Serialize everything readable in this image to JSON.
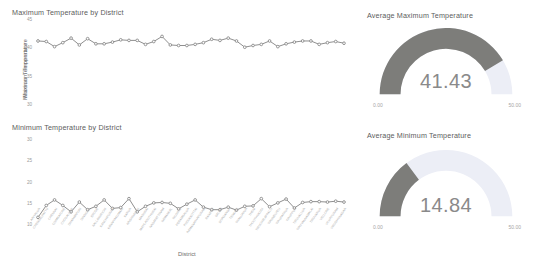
{
  "panels": {
    "max_line": {
      "title": "Maximum Temperature by District"
    },
    "min_line": {
      "title": "Minimum Temperature by District"
    },
    "gauge_max": {
      "title": "Average Maximum Temperature"
    },
    "gauge_min": {
      "title": "Average Minimum Temperature"
    }
  },
  "colors": {
    "line": "#8f8f8f",
    "marker": "#8a8a8a",
    "gauge_fill": "#7d7d7a",
    "gauge_track": "#eceef6",
    "text": "#5c5c5c",
    "muted": "#9a9a9a"
  },
  "chart_data": [
    {
      "type": "line",
      "title": "Maximum Temperature by District",
      "xlabel": "",
      "ylabel": "Maximum Temperature",
      "ylim": [
        30,
        45
      ],
      "yticks": [
        45,
        40,
        35,
        30
      ],
      "ytick_labels": [
        "45",
        "40",
        "35",
        "30"
      ],
      "grid": false,
      "legend": "none",
      "categories": [
        "ARIYALUR",
        "CHENGALPATTU",
        "CHENNAI",
        "COIMBATORE",
        "CUDDALORE",
        "DHARMAPURI",
        "DINDIGUL",
        "ERODE",
        "KALLAKURICHI",
        "KANCHIPURAM",
        "KANNIYAKUMARI",
        "KARUR",
        "KRISHNAGIRI",
        "MADURAI",
        "MAYILADUTHURAI",
        "NAGAPATTINAM",
        "NAMAKKAL",
        "NILGIRIS",
        "PERAMBALUR",
        "PUDUKKOTTAI",
        "RAMANATHAPURAM",
        "RANIPET",
        "SALEM",
        "SIVAGANGA",
        "TENKASI",
        "THANJAVUR",
        "THENI",
        "THOOTHUKUDI",
        "TIRUCHIRAPPALLI",
        "TIRUNELVELI",
        "TIRUPATHUR",
        "TIRUPPUR",
        "TIRUVALLUR",
        "TIRUVANNAMALAI",
        "TIRUVARUR",
        "VELLORE",
        "VILUPPURAM",
        "VIRUDHUNAGAR"
      ],
      "values": [
        41.3,
        41.2,
        40.3,
        41.0,
        41.8,
        40.6,
        41.7,
        40.8,
        40.8,
        41.1,
        41.5,
        41.4,
        41.4,
        40.7,
        41.2,
        42.1,
        40.6,
        40.5,
        40.5,
        40.7,
        41.0,
        41.6,
        41.4,
        41.8,
        41.3,
        40.2,
        40.5,
        40.7,
        41.3,
        40.3,
        40.8,
        41.1,
        41.3,
        41.3,
        40.7,
        41.0,
        41.2,
        40.9
      ]
    },
    {
      "type": "line",
      "title": "Minimum Temperature by District",
      "xlabel": "District",
      "ylabel": "Minimum Temperature",
      "ylim": [
        10,
        30
      ],
      "yticks": [
        30,
        25,
        20,
        15,
        10
      ],
      "ytick_labels": [
        "30",
        "25",
        "20",
        "15",
        "10"
      ],
      "grid": false,
      "legend": "none",
      "categories": [
        "ARIYALUR",
        "CHENGALPATTU",
        "CHENNAI",
        "COIMBATORE",
        "CUDDALORE",
        "DHARMAPURI",
        "DINDIGUL",
        "ERODE",
        "KALLAKURICHI",
        "KANCHIPURAM",
        "KANNIYAKUMARI",
        "KARUR",
        "KRISHNAGIRI",
        "MADURAI",
        "MAYILADUTHURAI",
        "NAGAPATTINAM",
        "NAMAKKAL",
        "NILGIRIS",
        "PERAMBALUR",
        "PUDUKKOTTAI",
        "RAMANATHAPURAM",
        "RANIPET",
        "SALEM",
        "SIVAGANGA",
        "TENKASI",
        "THANJAVUR",
        "THENI",
        "THOOTHUKUDI",
        "TIRUCHIRAPPALLI",
        "TIRUNELVELI",
        "TIRUPATHUR",
        "TIRUPPUR",
        "TIRUVALLUR",
        "TIRUVANNAMALAI",
        "TIRUVARUR",
        "VELLORE",
        "VILUPPURAM",
        "VIRUDHUNAGAR"
      ],
      "values": [
        11.8,
        14.6,
        15.9,
        14.6,
        13.1,
        15.4,
        13.6,
        14.4,
        15.9,
        13.9,
        14.1,
        16.2,
        13.1,
        14.4,
        15.2,
        15.3,
        15.1,
        13.8,
        14.9,
        15.9,
        14.2,
        13.6,
        13.6,
        14.2,
        13.5,
        14.4,
        14.5,
        16.2,
        14.3,
        15.2,
        16.1,
        14.0,
        15.3,
        15.5,
        15.5,
        15.4,
        15.6,
        15.4
      ]
    },
    {
      "type": "gauge",
      "title": "Average Maximum Temperature",
      "value": 41.43,
      "value_label": "41.43",
      "min": 0,
      "max": 50,
      "min_label": "0.00",
      "max_label": "50.00"
    },
    {
      "type": "gauge",
      "title": "Average Minimum Temperature",
      "value": 14.84,
      "value_label": "14.84",
      "min": 0,
      "max": 50,
      "min_label": "0.00",
      "max_label": "50.00"
    }
  ]
}
